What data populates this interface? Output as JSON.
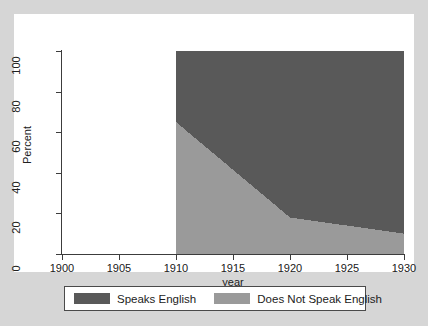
{
  "chart_data": {
    "type": "area",
    "title": "",
    "subtitle": "",
    "xlabel": "year",
    "ylabel": "Percent",
    "xlim": [
      1900,
      1930
    ],
    "ylim": [
      0,
      100
    ],
    "grid": false,
    "stacked": true,
    "legend_position": "bottom",
    "x_ticks": [
      1900,
      1905,
      1910,
      1915,
      1920,
      1925,
      1930
    ],
    "x_tick_labels": [
      "1900",
      "1905",
      "1910",
      "1915",
      "1920",
      "1925",
      "1930"
    ],
    "y_ticks": [
      0,
      20,
      40,
      60,
      80,
      100
    ],
    "y_tick_labels": [
      "0",
      "20",
      "40",
      "60",
      "80",
      "100"
    ],
    "x": [
      1910,
      1920,
      1930
    ],
    "series": [
      {
        "name": "Does Not Speak English",
        "color": "#9a9a9a",
        "values": [
          65,
          18,
          10
        ]
      },
      {
        "name": "Speaks English",
        "color": "#595959",
        "values": [
          35,
          82,
          90
        ]
      }
    ],
    "legend": [
      {
        "label": "Speaks English",
        "color": "#595959"
      },
      {
        "label": "Does Not Speak English",
        "color": "#9a9a9a"
      }
    ]
  },
  "colors": {
    "page_background": "#d6d6d6",
    "panel_background": "#ffffff",
    "axis": "#3c3c3c",
    "text": "#202020",
    "speaks_english": "#595959",
    "does_not_speak_english": "#9a9a9a"
  }
}
